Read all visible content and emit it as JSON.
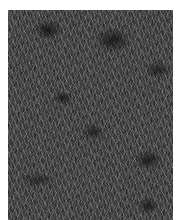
{
  "image": {
    "subject": "grass",
    "tone": "grayscale",
    "colors": {
      "border": "#ffffff",
      "base": "#3a3a3a",
      "shadow": "#0a0a0a",
      "highlight": "#dcdcdc"
    }
  }
}
